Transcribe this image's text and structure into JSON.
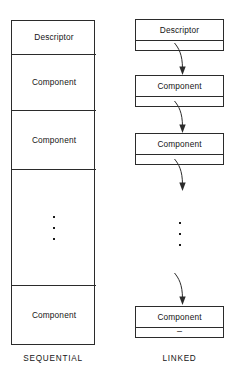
{
  "figure": {
    "background_color": "#ffffff",
    "line_color": "#2b2b2b",
    "text_color": "#141414"
  },
  "sequential": {
    "caption": "SEQUENTIAL",
    "cells": [
      {
        "label": "Descriptor",
        "kind": "descriptor"
      },
      {
        "label": "Component",
        "kind": "component"
      },
      {
        "label": "Component",
        "kind": "component"
      },
      {
        "label": "",
        "kind": "ellipsis"
      },
      {
        "label": "Component",
        "kind": "component"
      }
    ],
    "ellipsis": "⋮"
  },
  "linked": {
    "caption": "LINKED",
    "nodes": [
      {
        "label": "Descriptor",
        "pointer": "",
        "kind": "descriptor"
      },
      {
        "label": "Component",
        "pointer": "",
        "kind": "component"
      },
      {
        "label": "Component",
        "pointer": "",
        "kind": "component"
      },
      {
        "label": "Component",
        "pointer": "–",
        "kind": "component"
      }
    ],
    "ellipsis": "⋮",
    "null_pointer_mark": "–",
    "arrow_count": 4
  }
}
